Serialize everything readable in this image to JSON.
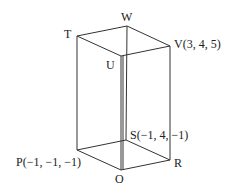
{
  "diagram": {
    "type": "cuboid",
    "line_color": "#333333",
    "vertices": [
      {
        "name": "T",
        "label": "T",
        "x": 77,
        "y": 36
      },
      {
        "name": "W",
        "label": "W",
        "x": 127,
        "y": 26
      },
      {
        "name": "V",
        "label": "V(3, 4, 5)",
        "x": 170,
        "y": 46
      },
      {
        "name": "U",
        "label": "U",
        "x": 121,
        "y": 56
      },
      {
        "name": "P",
        "label": "P(−1, −1, −1)",
        "x": 77,
        "y": 150
      },
      {
        "name": "S",
        "label": "S(−1, 4, −1)",
        "x": 126,
        "y": 140
      },
      {
        "name": "R",
        "label": "R",
        "x": 170,
        "y": 160
      },
      {
        "name": "Q",
        "label": "Q",
        "x": 121,
        "y": 170
      }
    ],
    "edges": [
      [
        "T",
        "W"
      ],
      [
        "W",
        "V"
      ],
      [
        "V",
        "U"
      ],
      [
        "U",
        "T"
      ],
      [
        "P",
        "S"
      ],
      [
        "S",
        "R"
      ],
      [
        "R",
        "Q"
      ],
      [
        "Q",
        "P"
      ],
      [
        "T",
        "P"
      ],
      [
        "W",
        "S"
      ],
      [
        "V",
        "R"
      ],
      [
        "U",
        "Q"
      ]
    ]
  },
  "labels": {
    "T": "T",
    "W": "W",
    "V": "V(3, 4, 5)",
    "U": "U",
    "P": "P(−1, −1, −1)",
    "S": "S(−1, 4, −1)",
    "R": "R",
    "Q": "Q"
  }
}
